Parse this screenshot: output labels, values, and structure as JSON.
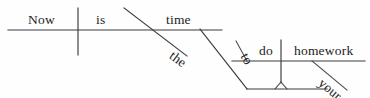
{
  "diagram": {
    "type": "reed-kellogg-sentence-diagram",
    "sentence": "Now is the time to do your homework",
    "ink_color": "#3a3a3a",
    "background_color": "#ffffff",
    "words": {
      "subject": "Now",
      "verb": "is",
      "modifier_the": "the",
      "complement": "time",
      "infinitive_marker": "to",
      "infinitive_verb": "do",
      "object": "homework",
      "possessive": "your"
    },
    "labels": [
      {
        "key": "now",
        "text": "Now",
        "x": 28,
        "y": 13,
        "rotate": 0
      },
      {
        "key": "is",
        "text": "is",
        "x": 96,
        "y": 13,
        "rotate": 0
      },
      {
        "key": "the",
        "text": "the",
        "x": 167,
        "y": 58,
        "rotate": 37
      },
      {
        "key": "time",
        "text": "time",
        "x": 166,
        "y": 13,
        "rotate": 0
      },
      {
        "key": "to",
        "text": "to",
        "x": 238,
        "y": 57,
        "rotate": 60
      },
      {
        "key": "do",
        "text": "do",
        "x": 259,
        "y": 43,
        "rotate": 0
      },
      {
        "key": "homework",
        "text": "homework",
        "x": 294,
        "y": 43,
        "rotate": 0
      },
      {
        "key": "your",
        "text": "your",
        "x": 316,
        "y": 85,
        "rotate": 40
      }
    ],
    "strokes": [
      {
        "key": "main-baseline",
        "kind": "horizontal",
        "x1": 8,
        "y1": 30,
        "x2": 222,
        "y2": 30
      },
      {
        "key": "subject-verb-divider",
        "kind": "vertical",
        "x1": 78,
        "y1": 8,
        "x2": 78,
        "y2": 55
      },
      {
        "key": "the-modifier-slant",
        "kind": "diagonal",
        "x1": 124,
        "y1": 8,
        "x2": 187,
        "y2": 56
      },
      {
        "key": "infinitive-stem",
        "kind": "diagonal",
        "x1": 200,
        "y1": 29,
        "x2": 247,
        "y2": 89
      },
      {
        "key": "infinitive-baseline",
        "kind": "horizontal",
        "x1": 232,
        "y1": 61,
        "x2": 365,
        "y2": 61
      },
      {
        "key": "to-slant",
        "kind": "diagonal",
        "x1": 247,
        "y1": 61,
        "x2": 236,
        "y2": 41
      },
      {
        "key": "do-object-divider",
        "kind": "vertical",
        "x1": 281,
        "y1": 40,
        "x2": 281,
        "y2": 83
      },
      {
        "key": "your-slant",
        "kind": "diagonal",
        "x1": 312,
        "y1": 61,
        "x2": 347,
        "y2": 90
      },
      {
        "key": "bottom-baseline",
        "kind": "horizontal",
        "x1": 247,
        "y1": 89,
        "x2": 327,
        "y2": 89
      },
      {
        "key": "pedestal-left",
        "kind": "diagonal",
        "x1": 281,
        "y1": 82,
        "x2": 275,
        "y2": 89
      },
      {
        "key": "pedestal-right",
        "kind": "diagonal",
        "x1": 281,
        "y1": 82,
        "x2": 287,
        "y2": 89
      }
    ]
  }
}
